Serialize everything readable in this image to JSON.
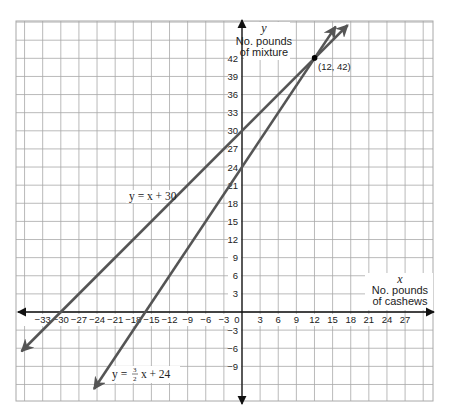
{
  "chart_data": {
    "type": "line",
    "title": "",
    "xlabel": "No. pounds of cashews",
    "xlabel_var": "x",
    "ylabel": "No. pounds of mixture",
    "ylabel_var": "y",
    "xlim": [
      -37.5,
      31.5
    ],
    "ylim": [
      -15,
      48
    ],
    "grid": true,
    "x_ticks": [
      -33,
      -30,
      -27,
      -24,
      -21,
      -18,
      -15,
      -12,
      -9,
      -6,
      -3,
      0,
      3,
      6,
      9,
      12,
      15,
      18,
      21,
      24,
      27
    ],
    "y_ticks": [
      -9,
      -6,
      -3,
      3,
      6,
      9,
      12,
      15,
      18,
      21,
      24,
      27,
      30,
      33,
      36,
      39,
      42
    ],
    "series": [
      {
        "name": "y = x + 30",
        "equation": "y = x + 30",
        "slope": 1,
        "intercept": 30,
        "x": [
          -36.5,
          17.5
        ],
        "y": [
          -6.5,
          47.5
        ]
      },
      {
        "name": "y = 3/2 x + 24",
        "equation": "y = (3/2) x + 24",
        "slope": 1.5,
        "intercept": 24,
        "x": [
          -24.5,
          15.5
        ],
        "y": [
          -12.75,
          47.25
        ]
      }
    ],
    "annotations": [
      {
        "text": "(12, 42)",
        "x": 12,
        "y": 42,
        "type": "intersection-point"
      },
      {
        "text": "y = x + 30",
        "type": "line-label"
      },
      {
        "text": "y = 3/2 x + 24",
        "type": "line-label"
      }
    ]
  },
  "labels": {
    "y_var": "y",
    "y_line1": "No. pounds",
    "y_line2": "of mixture",
    "x_var": "x",
    "x_line1": "No. pounds",
    "x_line2": "of cashews",
    "point": "(12, 42)",
    "eq1": "y = x + 30",
    "eq2_prefix": "y = ",
    "eq2_num": "3",
    "eq2_den": "2",
    "eq2_suffix": " x + 24",
    "origin": "0"
  },
  "colors": {
    "grid": "#a8a8a8",
    "axis": "#111111",
    "line": "#555555",
    "point": "#000000"
  }
}
